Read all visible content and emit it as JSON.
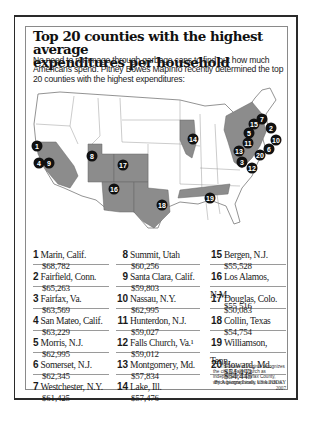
{
  "header": {
    "title_line1": "Top 20 counties with the highest average",
    "title_line2": "expenditures per household",
    "intro": "No need to rummage through garbage cans to find out how much Americans spend. Pitney Bowes MapInfo recently determined the top 20 counties with the highest expenditures:"
  },
  "map": {
    "highlight_color": "#8c8c8c",
    "badge_color": "#111111",
    "markers": [
      {
        "rank": "1"
      },
      {
        "rank": "2"
      },
      {
        "rank": "3"
      },
      {
        "rank": "4"
      },
      {
        "rank": "5"
      },
      {
        "rank": "6"
      },
      {
        "rank": "7"
      },
      {
        "rank": "8"
      },
      {
        "rank": "9"
      },
      {
        "rank": "10"
      },
      {
        "rank": "11"
      },
      {
        "rank": "12"
      },
      {
        "rank": "13"
      },
      {
        "rank": "14"
      },
      {
        "rank": "15"
      },
      {
        "rank": "16"
      },
      {
        "rank": "17"
      },
      {
        "rank": "18"
      },
      {
        "rank": "19"
      }
    ]
  },
  "counties": [
    {
      "rank": "1",
      "name": "Marin, Calif.",
      "value": "$68,782"
    },
    {
      "rank": "2",
      "name": "Fairfield, Conn.",
      "value": "$65,263"
    },
    {
      "rank": "3",
      "name": "Fairfax, Va.",
      "value": "$63,569"
    },
    {
      "rank": "4",
      "name": "San Mateo, Calif.",
      "value": "$63,229"
    },
    {
      "rank": "5",
      "name": "Morris, N.J.",
      "value": "$62,995"
    },
    {
      "rank": "6",
      "name": "Somerset, N.J.",
      "value": "$62,345"
    },
    {
      "rank": "7",
      "name": "Westchester, N.Y.",
      "value": "$61,425"
    },
    {
      "rank": "8",
      "name": "Summit, Utah",
      "value": "$60,256"
    },
    {
      "rank": "9",
      "name": "Santa Clara, Calif.",
      "value": "$59,803"
    },
    {
      "rank": "10",
      "name": "Nassau, N.Y.",
      "value": "$62,995"
    },
    {
      "rank": "11",
      "name": "Hunterdon, N.J.",
      "value": "$59,027"
    },
    {
      "rank": "12",
      "name": "Falls Church, Va.¹",
      "value": "$59,012"
    },
    {
      "rank": "13",
      "name": "Montgomery, Md.",
      "value": "$57,834"
    },
    {
      "rank": "14",
      "name": "Lake, Ill.",
      "value": "$57,476"
    },
    {
      "rank": "15",
      "name": "Bergen, N.J.",
      "value": "$55,528"
    },
    {
      "rank": "16",
      "name": "Los Alamos, N.M.",
      "value": "$55,516"
    },
    {
      "rank": "17",
      "name": "Douglas, Colo.",
      "value": "$50,083"
    },
    {
      "rank": "18",
      "name": "Collin, Texas",
      "value": "$54,754"
    },
    {
      "rank": "19",
      "name": "Williamson, Tenn.",
      "value": "$54,493"
    },
    {
      "rank": "20",
      "name": "Howard, Md.",
      "value": "$54,445"
    }
  ],
  "footnote": "1 – The state of Virginia recognizes the city of Falls Church as independent of Fairfax County, which geographically surrounds it.",
  "byline": {
    "author": "By Adrienne Lewis, USA TODAY",
    "year": "2007"
  }
}
